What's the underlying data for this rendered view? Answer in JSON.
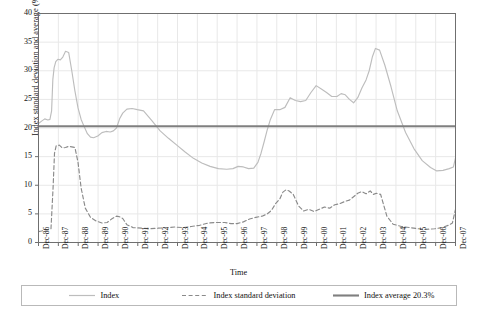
{
  "chart_data": {
    "type": "line",
    "title": "",
    "xlabel": "Time",
    "ylabel": "Index standard deviation and average (%)",
    "ylim": [
      0,
      40
    ],
    "yticks": [
      0,
      5,
      10,
      15,
      20,
      25,
      30,
      35,
      40
    ],
    "grid": true,
    "legend_position": "bottom",
    "categories": [
      "Dec-86",
      "Dec-87",
      "Dec-88",
      "Dec-89",
      "Dec-90",
      "Dec-91",
      "Dec-92",
      "Dec-93",
      "Dec-94",
      "Dec-95",
      "Dec-96",
      "Dec-97",
      "Dec-98",
      "Dec-99",
      "Dec-00",
      "Dec-01",
      "Dec-02",
      "Dec-03",
      "Dec-04",
      "Dec-05",
      "Dec-06",
      "Dec-07"
    ],
    "x_range": [
      "Dec-86",
      "Dec-07"
    ],
    "series": [
      {
        "name": "Index",
        "style": "solid",
        "color": "#bdbdbd",
        "x": [
          1986.95,
          1987.1,
          1987.25,
          1987.4,
          1987.5,
          1987.58,
          1987.64,
          1987.7,
          1987.78,
          1987.88,
          1988.0,
          1988.12,
          1988.25,
          1988.4,
          1988.55,
          1988.7,
          1988.85,
          1989.0,
          1989.15,
          1989.3,
          1989.45,
          1989.6,
          1989.8,
          1990.0,
          1990.2,
          1990.4,
          1990.55,
          1990.7,
          1990.85,
          1991.0,
          1991.2,
          1991.45,
          1991.7,
          1992.0,
          1992.4,
          1992.8,
          1993.2,
          1993.6,
          1994.0,
          1994.4,
          1994.8,
          1995.2,
          1995.6,
          1996.0,
          1996.3,
          1996.55,
          1996.8,
          1997.05,
          1997.3,
          1997.5,
          1997.65,
          1997.8,
          1997.95,
          1998.1,
          1998.3,
          1998.55,
          1998.8,
          1999.05,
          1999.3,
          1999.55,
          1999.8,
          2000.05,
          2000.3,
          2000.55,
          2000.8,
          2001.05,
          2001.3,
          2001.5,
          2001.7,
          2001.9,
          2002.1,
          2002.3,
          2002.5,
          2002.7,
          2002.85,
          2003.0,
          2003.15,
          2003.35,
          2003.6,
          2003.9,
          2004.2,
          2004.6,
          2005.0,
          2005.4,
          2005.8,
          2006.1,
          2006.4,
          2006.7,
          2006.9,
          2007.0
        ],
        "y": [
          20.8,
          21.2,
          21.6,
          21.4,
          21.5,
          23.0,
          28.5,
          30.5,
          31.6,
          32.0,
          31.9,
          32.4,
          33.4,
          33.2,
          30.0,
          26.5,
          23.5,
          21.5,
          20.2,
          19.0,
          18.4,
          18.3,
          18.6,
          19.2,
          19.4,
          19.3,
          19.5,
          20.0,
          21.6,
          22.6,
          23.3,
          23.4,
          23.2,
          23.0,
          21.3,
          19.5,
          18.2,
          17.0,
          15.8,
          14.7,
          13.9,
          13.3,
          12.9,
          12.8,
          12.9,
          13.3,
          13.2,
          12.9,
          13.0,
          14.0,
          15.6,
          17.6,
          19.7,
          21.5,
          23.2,
          23.2,
          23.6,
          25.3,
          24.8,
          24.6,
          24.8,
          26.2,
          27.4,
          26.8,
          26.2,
          25.5,
          25.5,
          26.0,
          25.8,
          25.0,
          24.4,
          25.3,
          27.0,
          28.4,
          30.0,
          32.4,
          33.9,
          33.6,
          31.0,
          27.2,
          23.0,
          19.2,
          16.4,
          14.3,
          13.1,
          12.5,
          12.6,
          12.9,
          13.2,
          14.8
        ]
      },
      {
        "name": "Index standard deviation",
        "style": "dashed",
        "color": "#8a8a8a",
        "x": [
          1986.95,
          1987.1,
          1987.25,
          1987.4,
          1987.55,
          1987.65,
          1987.72,
          1987.8,
          1987.95,
          1988.1,
          1988.25,
          1988.4,
          1988.55,
          1988.7,
          1988.85,
          1989.0,
          1989.2,
          1989.45,
          1989.7,
          1990.0,
          1990.25,
          1990.5,
          1990.7,
          1990.85,
          1991.0,
          1991.2,
          1991.5,
          1991.9,
          1992.3,
          1992.7,
          1993.1,
          1993.5,
          1993.9,
          1994.3,
          1994.7,
          1995.1,
          1995.5,
          1995.9,
          1996.2,
          1996.5,
          1996.8,
          1997.1,
          1997.4,
          1997.7,
          1997.95,
          1998.15,
          1998.35,
          1998.55,
          1998.7,
          1998.85,
          1999.0,
          1999.2,
          1999.45,
          1999.7,
          1999.95,
          2000.2,
          2000.45,
          2000.7,
          2000.95,
          2001.2,
          2001.45,
          2001.7,
          2001.9,
          2002.1,
          2002.3,
          2002.5,
          2002.7,
          2002.9,
          2003.05,
          2003.2,
          2003.4,
          2003.7,
          2004.0,
          2004.4,
          2004.8,
          2005.2,
          2005.6,
          2006.0,
          2006.35,
          2006.65,
          2006.85,
          2007.0
        ],
        "y": [
          1.9,
          2.0,
          2.3,
          2.2,
          2.4,
          9.5,
          15.6,
          16.9,
          17.0,
          16.5,
          16.6,
          16.8,
          16.7,
          16.6,
          14.0,
          9.5,
          6.0,
          4.4,
          3.8,
          3.4,
          3.5,
          4.2,
          4.6,
          4.5,
          4.2,
          3.1,
          2.6,
          2.5,
          2.4,
          2.5,
          2.6,
          2.7,
          2.6,
          2.8,
          3.0,
          3.4,
          3.5,
          3.5,
          3.3,
          3.3,
          3.6,
          4.1,
          4.4,
          4.6,
          5.0,
          5.6,
          6.8,
          7.6,
          8.8,
          9.2,
          9.0,
          8.4,
          6.4,
          5.5,
          5.8,
          5.4,
          5.8,
          6.2,
          6.0,
          6.6,
          6.8,
          7.2,
          7.4,
          8.0,
          8.6,
          8.9,
          8.5,
          9.0,
          8.4,
          8.6,
          8.4,
          4.6,
          3.2,
          2.8,
          2.6,
          2.4,
          2.3,
          2.4,
          2.6,
          3.0,
          3.4,
          5.8
        ]
      },
      {
        "name": "Index average 20.3%",
        "style": "solid-thick",
        "color": "#7f7f7f",
        "constant_value": 20.3
      }
    ],
    "legend": [
      {
        "label": "Index",
        "style": "solid",
        "color": "#bdbdbd"
      },
      {
        "label": "Index standard deviation",
        "style": "dashed",
        "color": "#8a8a8a"
      },
      {
        "label": "Index average 20.3%",
        "style": "solid-thick",
        "color": "#7f7f7f"
      }
    ]
  }
}
